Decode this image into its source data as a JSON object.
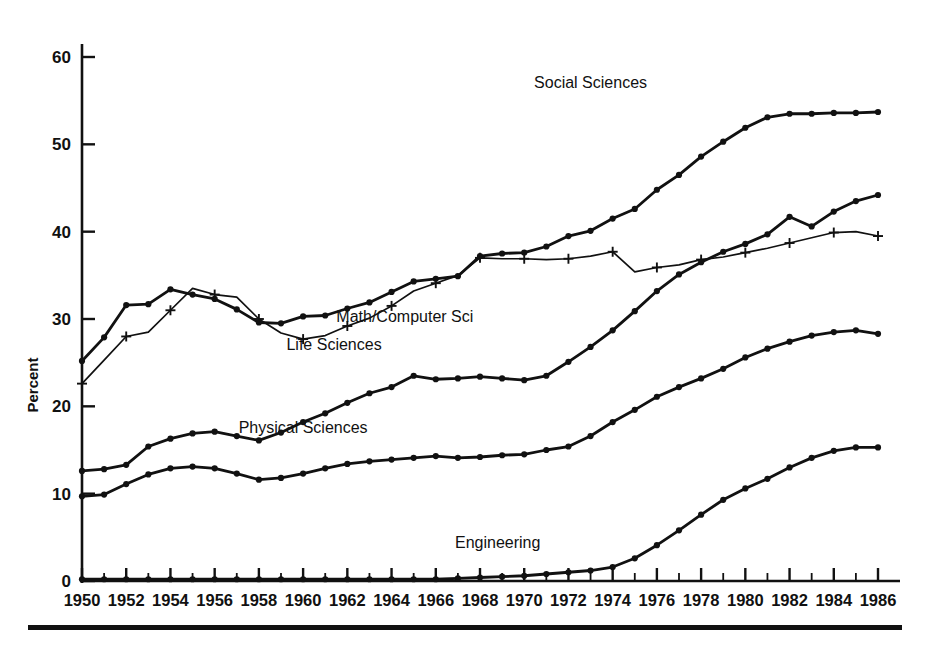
{
  "figure": {
    "y_axis_title": "Percent",
    "background_color": "#ffffff",
    "ink_color": "#111111"
  },
  "series_labels": {
    "social_sciences": "Social Sciences",
    "math_computer_sci": "Math/Computer Sci",
    "life_sciences": "Life Sciences",
    "physical_sciences": "Physical Sciences",
    "engineering": "Engineering"
  },
  "chart_data": {
    "type": "line",
    "title": "",
    "subtitle": "",
    "xlabel": "",
    "ylabel": "Percent",
    "xlim": [
      1950,
      1986
    ],
    "ylim": [
      0,
      62
    ],
    "yticks": [
      0,
      10,
      20,
      30,
      40,
      50,
      60
    ],
    "ytick_labels": [
      "0",
      "10",
      "20",
      "30",
      "40",
      "50",
      "60"
    ],
    "xticks": [
      1950,
      1952,
      1954,
      1956,
      1958,
      1960,
      1962,
      1964,
      1966,
      1968,
      1970,
      1972,
      1974,
      1976,
      1978,
      1980,
      1982,
      1984,
      1986
    ],
    "xtick_labels": [
      "1950",
      "1952",
      "1954",
      "1956",
      "1958",
      "1960",
      "1962",
      "1964",
      "1966",
      "1968",
      "1970",
      "1972",
      "1974",
      "1976",
      "1978",
      "1980",
      "1982",
      "1984",
      "1986"
    ],
    "minor_xticks_every": 1,
    "grid": false,
    "legend": "inline-annotations",
    "x": [
      1950,
      1951,
      1952,
      1953,
      1954,
      1955,
      1956,
      1957,
      1958,
      1959,
      1960,
      1961,
      1962,
      1963,
      1964,
      1965,
      1966,
      1967,
      1968,
      1969,
      1970,
      1971,
      1972,
      1973,
      1974,
      1975,
      1976,
      1977,
      1978,
      1979,
      1980,
      1981,
      1982,
      1983,
      1984,
      1985,
      1986
    ],
    "series": [
      {
        "name": "Social Sciences",
        "marker": "filled-circle",
        "label_x": 1973.0,
        "label_y": 56.5,
        "values": [
          25.2,
          27.9,
          31.6,
          31.7,
          33.4,
          32.8,
          32.3,
          31.1,
          29.6,
          29.5,
          30.3,
          30.4,
          31.2,
          31.9,
          33.1,
          34.3,
          34.6,
          34.9,
          37.2,
          37.5,
          37.6,
          38.3,
          39.5,
          40.1,
          41.5,
          42.6,
          44.8,
          46.5,
          48.6,
          50.3,
          51.9,
          53.1,
          53.5,
          53.5,
          53.6,
          53.6,
          53.7
        ]
      },
      {
        "name": "Math/Computer Sci",
        "marker": "plus",
        "label_x": 1964.6,
        "label_y": 29.6,
        "values": [
          22.6,
          25.3,
          28.0,
          28.5,
          31.0,
          33.5,
          32.8,
          32.5,
          30.0,
          28.4,
          27.7,
          28.1,
          29.2,
          30.1,
          31.5,
          33.2,
          34.1,
          35.0,
          37.0,
          36.9,
          36.9,
          36.8,
          36.9,
          37.2,
          37.7,
          35.4,
          35.9,
          36.2,
          36.8,
          37.1,
          37.6,
          38.1,
          38.7,
          39.3,
          39.9,
          40.0,
          39.5
        ]
      },
      {
        "name": "Life Sciences",
        "marker": "filled-circle",
        "label_x": 1961.4,
        "label_y": 26.5,
        "values": [
          12.6,
          12.8,
          13.3,
          15.4,
          16.3,
          16.9,
          17.1,
          16.6,
          16.1,
          17.0,
          18.2,
          19.2,
          20.4,
          21.5,
          22.2,
          23.5,
          23.1,
          23.2,
          23.4,
          23.2,
          23.0,
          23.5,
          25.1,
          26.8,
          28.7,
          30.9,
          33.2,
          35.1,
          36.5,
          37.7,
          38.6,
          39.7,
          41.7,
          40.6,
          42.3,
          43.5,
          44.2
        ]
      },
      {
        "name": "Physical Sciences",
        "marker": "filled-circle",
        "label_x": 1960.0,
        "label_y": 17.0,
        "values": [
          9.7,
          9.9,
          11.1,
          12.2,
          12.9,
          13.1,
          12.9,
          12.3,
          11.6,
          11.8,
          12.3,
          12.9,
          13.4,
          13.7,
          13.9,
          14.1,
          14.3,
          14.1,
          14.2,
          14.4,
          14.5,
          15.0,
          15.4,
          16.6,
          18.2,
          19.6,
          21.1,
          22.2,
          23.2,
          24.3,
          25.6,
          26.6,
          27.4,
          28.1,
          28.5,
          28.7,
          28.3
        ]
      },
      {
        "name": "Engineering",
        "marker": "filled-circle",
        "label_x": 1968.8,
        "label_y": 3.8,
        "values": [
          0.2,
          0.2,
          0.2,
          0.2,
          0.2,
          0.2,
          0.2,
          0.2,
          0.2,
          0.2,
          0.2,
          0.2,
          0.2,
          0.2,
          0.2,
          0.2,
          0.2,
          0.3,
          0.4,
          0.5,
          0.6,
          0.8,
          1.0,
          1.2,
          1.6,
          2.6,
          4.1,
          5.8,
          7.6,
          9.3,
          10.6,
          11.7,
          13.0,
          14.1,
          14.9,
          15.3,
          15.3
        ]
      }
    ]
  }
}
